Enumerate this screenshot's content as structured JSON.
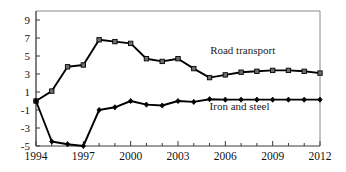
{
  "chart_data": {
    "type": "line",
    "title": "",
    "subtitle": "",
    "xlabel": "",
    "ylabel": "",
    "xlim": [
      1994,
      2012
    ],
    "ylim": [
      -5,
      10
    ],
    "grid": false,
    "legend_position": "inline-annotation",
    "x": [
      1994,
      1995,
      1996,
      1997,
      1998,
      1999,
      2000,
      2001,
      2002,
      2003,
      2004,
      2005,
      2006,
      2007,
      2008,
      2009,
      2010,
      2011,
      2012
    ],
    "xticks_major": [
      1994,
      1997,
      2000,
      2003,
      2006,
      2009,
      2012
    ],
    "xtick_labels": [
      "1994",
      "1997",
      "2000",
      "2003",
      "2006",
      "2009",
      "2012"
    ],
    "yticks": [
      -5,
      -3,
      -1,
      1,
      3,
      5,
      7,
      9
    ],
    "ytick_labels": [
      "-5",
      "-3",
      "-1",
      "1",
      "3",
      "5",
      "7",
      "9"
    ],
    "series": [
      {
        "name": "Road transport",
        "marker": "square",
        "color": "#000000",
        "label_x": 2007.1,
        "label_y": 5.2,
        "values": [
          0.0,
          1.1,
          3.8,
          4.0,
          6.8,
          6.6,
          6.4,
          4.7,
          4.4,
          4.7,
          3.6,
          2.6,
          2.9,
          3.2,
          3.3,
          3.4,
          3.4,
          3.3,
          3.1
        ]
      },
      {
        "name": "Iron and steel",
        "marker": "diamond",
        "color": "#000000",
        "label_x": 2006.9,
        "label_y": -1.0,
        "values": [
          0.0,
          -4.5,
          -4.8,
          -5.0,
          -1.0,
          -0.7,
          0.0,
          -0.4,
          -0.5,
          0.0,
          -0.1,
          0.2,
          0.15,
          0.15,
          0.15,
          0.15,
          0.15,
          0.15,
          0.15
        ]
      }
    ]
  },
  "annotations": {
    "road_transport_label": "Road transport",
    "iron_and_steel_label": "Iron and steel"
  },
  "colors": {
    "line": "#000000",
    "frame": "#8a8a8a",
    "axis": "#3a3a3a",
    "background": "#ffffff",
    "marker_fill": "#6e6e6e"
  }
}
